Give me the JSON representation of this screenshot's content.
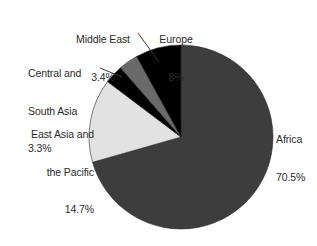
{
  "chart_data": {
    "type": "pie",
    "title": "",
    "subtitle": "",
    "xlabel": "",
    "ylabel": "",
    "legend_position": "none",
    "grid": false,
    "labels_show_value": true,
    "categories": [
      "Africa",
      "East Asia and the Pacific",
      "Central and South Asia",
      "Middle East",
      "Europe"
    ],
    "values": [
      70.5,
      14.7,
      3.3,
      3.4,
      8
    ],
    "value_labels": [
      "70.5%",
      "14.7%",
      "3.3%",
      "3.4%",
      "8%"
    ],
    "colors": [
      "#3d3d3d",
      "#e2e2e2",
      "#000000",
      "#6a6a6a",
      "#000000"
    ],
    "start_angle_deg": 0,
    "direction": "clockwise",
    "units": "percent",
    "total": 99.9
  },
  "slices": [
    {
      "id": "africa",
      "name": "Africa",
      "value": 70.5,
      "value_label": "70.5%",
      "color": "#3d3d3d",
      "name_line_1": "Africa",
      "name_line_2": ""
    },
    {
      "id": "east-asia-pacific",
      "name": "East Asia and the Pacific",
      "value": 14.7,
      "value_label": "14.7%",
      "color": "#e2e2e2",
      "name_line_1": "East Asia and",
      "name_line_2": "the Pacific"
    },
    {
      "id": "central-south-asia",
      "name": "Central and South Asia",
      "value": 3.3,
      "value_label": "3.3%",
      "color": "#000000",
      "name_line_1": "Central and",
      "name_line_2": "South Asia"
    },
    {
      "id": "middle-east",
      "name": "Middle East",
      "value": 3.4,
      "value_label": "3.4%",
      "color": "#6a6a6a",
      "name_line_1": "Middle East",
      "name_line_2": ""
    },
    {
      "id": "europe",
      "name": "Europe",
      "value": 8,
      "value_label": "8%",
      "color": "#000000",
      "name_line_1": "Europe",
      "name_line_2": ""
    }
  ],
  "style": {
    "background": "#ffffff",
    "text_color": "#2b2b2b",
    "leader_line_color": "#3a3a3a",
    "pie_outline_color": "#2a2a2a"
  }
}
